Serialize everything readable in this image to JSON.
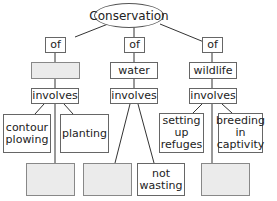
{
  "root": {
    "label": "Conservation"
  },
  "branches": [
    {
      "of_label": "of",
      "subject": "",
      "subject_blank": true,
      "involves_label": "involves",
      "examples": [
        {
          "label": "contour\nplowing",
          "blank": false
        },
        {
          "label": "planting",
          "blank": false
        },
        {
          "label": "",
          "blank": true
        }
      ]
    },
    {
      "of_label": "of",
      "subject": "water",
      "subject_blank": false,
      "involves_label": "involves",
      "examples": [
        {
          "label": "",
          "blank": true
        },
        {
          "label": "not\nwasting",
          "blank": false
        }
      ]
    },
    {
      "of_label": "of",
      "subject": "wildlife",
      "subject_blank": false,
      "involves_label": "involves",
      "examples": [
        {
          "label": "setting\nup\nrefuges",
          "blank": false
        },
        {
          "label": "breeding\nin\ncaptivity",
          "blank": false
        },
        {
          "label": "",
          "blank": true
        }
      ]
    }
  ],
  "colors": {
    "line": "#333333",
    "border": "#666666",
    "blank_fill": "#ebebeb"
  }
}
